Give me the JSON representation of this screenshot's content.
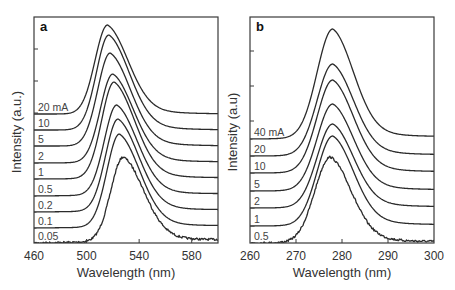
{
  "chart_data": [
    {
      "type": "line",
      "panel": "a",
      "title": "",
      "xlabel": "Wavelength (nm)",
      "ylabel": "Intensity (a.u.)",
      "xlim": [
        460,
        600
      ],
      "xticks": [
        460,
        500,
        540,
        580
      ],
      "ytick_count": 4,
      "grid": false,
      "legend": "inline labels at left of each curve (stacked/offset spectra)",
      "series": [
        {
          "name": "20 mA",
          "label": "20 mA",
          "peak_nm": 516,
          "peak_y_px": 25,
          "baseline_left_px": 114,
          "baseline_right_px": 114,
          "noisy": false
        },
        {
          "name": "10",
          "label": "10",
          "peak_nm": 517,
          "peak_y_px": 35,
          "baseline_left_px": 130,
          "baseline_right_px": 130,
          "noisy": false
        },
        {
          "name": "5",
          "label": "5",
          "peak_nm": 518,
          "peak_y_px": 53,
          "baseline_left_px": 146,
          "baseline_right_px": 146,
          "noisy": false
        },
        {
          "name": "2",
          "label": "2",
          "peak_nm": 520,
          "peak_y_px": 74,
          "baseline_left_px": 163,
          "baseline_right_px": 162,
          "noisy": false
        },
        {
          "name": "1",
          "label": "1",
          "peak_nm": 521,
          "peak_y_px": 82,
          "baseline_left_px": 179,
          "baseline_right_px": 178,
          "noisy": false
        },
        {
          "name": "0.5",
          "label": "0.5",
          "peak_nm": 523,
          "peak_y_px": 105,
          "baseline_left_px": 196,
          "baseline_right_px": 194,
          "noisy": false
        },
        {
          "name": "0.2",
          "label": "0.2",
          "peak_nm": 524,
          "peak_y_px": 119,
          "baseline_left_px": 212,
          "baseline_right_px": 210,
          "noisy": false
        },
        {
          "name": "0.1",
          "label": "0.1",
          "peak_nm": 525,
          "peak_y_px": 134,
          "baseline_left_px": 228,
          "baseline_right_px": 226,
          "noisy": false
        },
        {
          "name": "0.05",
          "label": "0.05",
          "peak_nm": 528,
          "peak_y_px": 157,
          "baseline_left_px": 243,
          "baseline_right_px": 240,
          "noisy": true
        }
      ]
    },
    {
      "type": "line",
      "panel": "b",
      "title": "",
      "xlabel": "Wavelength (nm)",
      "ylabel": "Intensity (a.u)",
      "xlim": [
        260,
        300
      ],
      "xticks": [
        260,
        270,
        280,
        290,
        300
      ],
      "ytick_count": 3,
      "grid": false,
      "legend": "inline labels at left of each curve (stacked/offset spectra)",
      "series": [
        {
          "name": "40 mA",
          "label": "40 mA",
          "peak_nm": 278,
          "peak_y_px": 29,
          "baseline_left_px": 139,
          "baseline_right_px": 137,
          "noisy": false
        },
        {
          "name": "20",
          "label": "20",
          "peak_nm": 278,
          "peak_y_px": 64,
          "baseline_left_px": 156,
          "baseline_right_px": 155,
          "noisy": false
        },
        {
          "name": "10",
          "label": "10",
          "peak_nm": 278,
          "peak_y_px": 80,
          "baseline_left_px": 173,
          "baseline_right_px": 172,
          "noisy": false
        },
        {
          "name": "5",
          "label": "5",
          "peak_nm": 278,
          "peak_y_px": 104,
          "baseline_left_px": 191,
          "baseline_right_px": 190,
          "noisy": false
        },
        {
          "name": "2",
          "label": "2",
          "peak_nm": 278,
          "peak_y_px": 124,
          "baseline_left_px": 208,
          "baseline_right_px": 207,
          "noisy": false
        },
        {
          "name": "1",
          "label": "1",
          "peak_nm": 278,
          "peak_y_px": 136,
          "baseline_left_px": 226,
          "baseline_right_px": 225,
          "noisy": false
        },
        {
          "name": "0.5",
          "label": "0.5",
          "peak_nm": 277.5,
          "peak_y_px": 157,
          "baseline_left_px": 243,
          "baseline_right_px": 242,
          "noisy": true
        }
      ]
    }
  ],
  "panels": [
    {
      "letter": "a",
      "xlabel": "Wavelength (nm)",
      "ylabel": "Intensity (a.u.)",
      "xtick_labels": [
        "460",
        "500",
        "540",
        "580"
      ],
      "frame": {
        "left": 34,
        "top": 17,
        "right": 218,
        "bottom": 243
      },
      "xrange": [
        460,
        600
      ],
      "xtick_values": [
        460,
        500,
        540,
        580
      ],
      "ytick_px": [
        49,
        81,
        113
      ],
      "shape": {
        "sigma_left_nm": 9.5,
        "sigma_right_nm": 16,
        "tail_right_nm": 22
      }
    },
    {
      "letter": "b",
      "xlabel": "Wavelength (nm)",
      "ylabel": "Intensity (a.u)",
      "xtick_labels": [
        "260",
        "270",
        "280",
        "290",
        "300"
      ],
      "frame": {
        "left": 250,
        "top": 17,
        "right": 434,
        "bottom": 243
      },
      "xrange": [
        260,
        300
      ],
      "xtick_values": [
        260,
        270,
        280,
        290,
        300
      ],
      "ytick_px": [
        51,
        86,
        121
      ],
      "shape": {
        "sigma_left_nm": 3.4,
        "sigma_right_nm": 4.6,
        "tail_right_nm": 7
      }
    }
  ]
}
